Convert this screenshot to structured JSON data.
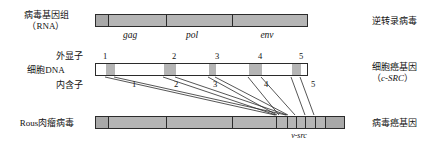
{
  "figure": {
    "rows": [
      {
        "id": "viral-genome",
        "left_label_line1": "病毒基因组",
        "left_label_line2": "（RNA）",
        "right_label_line1": "逆转录病毒",
        "right_label_line2": "",
        "genes": [
          "gag",
          "pol",
          "env"
        ]
      },
      {
        "id": "cellular-dna",
        "left_label_line1": "细胞DNA",
        "left_label_line2": "",
        "right_label_line1": "细胞癌基因",
        "right_label_line2": "（c-SRC）",
        "right_label_line2_italic": "c-SRC",
        "exon_caption": "外显子",
        "intron_caption": "内含子",
        "exon_numbers": [
          "1",
          "2",
          "3",
          "4",
          "5"
        ],
        "intron_numbers": [
          "1",
          "2",
          "3",
          "4",
          "5"
        ]
      },
      {
        "id": "rous-sarcoma-virus",
        "left_label_line1": "Rous肉瘤病毒",
        "left_label_line2": "",
        "right_label_line1": "病毒癌基因",
        "right_label_line2": "",
        "vsrc_label": "v-src"
      }
    ],
    "colors": {
      "exon_fill": "#b5b5b5",
      "intron_fill": "#ffffff",
      "viral_fill": "#b5b5b5",
      "outline": "#2b2b2b",
      "text": "#111111"
    }
  }
}
